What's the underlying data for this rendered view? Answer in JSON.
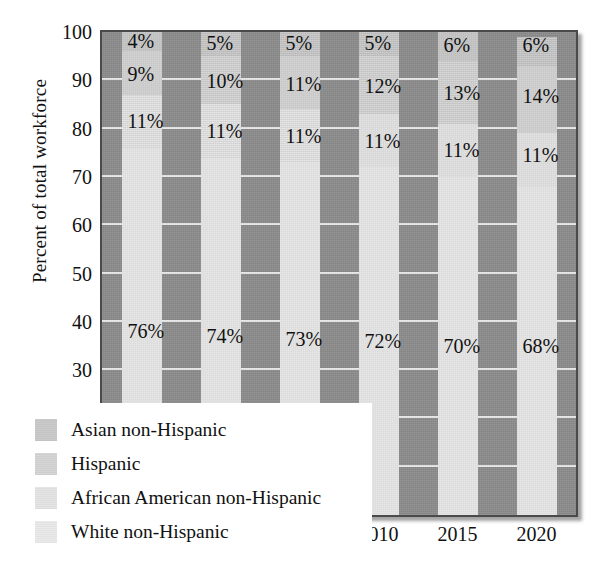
{
  "chart_data": {
    "type": "bar",
    "subtype": "stacked-bar-100-percent",
    "title": "",
    "xlabel": "",
    "ylabel": "Percent of total workforce",
    "ylim": [
      0,
      100
    ],
    "ytick_step": 10,
    "yticks": [
      "100",
      "90",
      "80",
      "70",
      "60",
      "50",
      "40",
      "30",
      "20",
      "10",
      "0"
    ],
    "grid": true,
    "grid_orientation": "horizontal",
    "legend_position": "inside-bottom-left",
    "categories": [
      "1995",
      "2000",
      "2005",
      "2010",
      "2015",
      "2020"
    ],
    "series": [
      {
        "name": "Asian non-Hispanic",
        "color": "#c9c9c9",
        "values": [
          4,
          5,
          5,
          5,
          6,
          6
        ],
        "labels": [
          "4%",
          "5%",
          "5%",
          "5%",
          "6%",
          "6%"
        ]
      },
      {
        "name": "Hispanic",
        "color": "#d4d4d4",
        "values": [
          9,
          10,
          11,
          12,
          13,
          14
        ],
        "labels": [
          "9%",
          "10%",
          "11%",
          "12%",
          "13%",
          "14%"
        ]
      },
      {
        "name": "African American non-Hispanic",
        "color": "#e4e4e4",
        "values": [
          11,
          11,
          11,
          11,
          11,
          11
        ],
        "labels": [
          "11%",
          "11%",
          "11%",
          "11%",
          "11%",
          "11%"
        ]
      },
      {
        "name": "White non-Hispanic",
        "color": "#e9e9e9",
        "values": [
          76,
          74,
          73,
          72,
          70,
          68
        ],
        "labels": [
          "76%",
          "74%",
          "73%",
          "72%",
          "70%",
          "68%"
        ]
      }
    ],
    "plot_background_color": "#8e8e8e",
    "gridline_color": "#f2f2f2",
    "frame_color": "#4a4a4a"
  },
  "legend": {
    "items": [
      {
        "label": "Asian non-Hispanic"
      },
      {
        "label": "Hispanic"
      },
      {
        "label": "African American non-Hispanic"
      },
      {
        "label": "White non-Hispanic"
      }
    ]
  }
}
